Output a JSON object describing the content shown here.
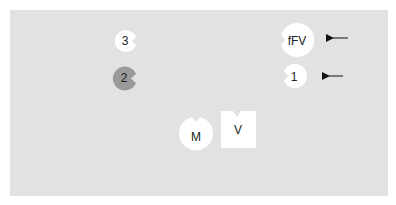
{
  "diagram": {
    "background_color": "#e2e2e2",
    "nodes": [
      {
        "id": "node-3",
        "label": "3",
        "shape": "notched-circle",
        "fill": "#ffffff"
      },
      {
        "id": "node-2",
        "label": "2",
        "shape": "notched-circle",
        "fill": "#9a9a9a"
      },
      {
        "id": "node-fFV",
        "label": "fFV",
        "shape": "notched-circle",
        "fill": "#ffffff"
      },
      {
        "id": "node-1",
        "label": "1",
        "shape": "notched-circle",
        "fill": "#ffffff"
      },
      {
        "id": "node-M",
        "label": "M",
        "shape": "notched-circle",
        "fill": "#ffffff"
      },
      {
        "id": "node-V",
        "label": "V",
        "shape": "notched-square",
        "fill": "#ffffff"
      }
    ],
    "arrows": [
      {
        "target": "fFV",
        "direction": "left"
      },
      {
        "target": "1",
        "direction": "left"
      }
    ]
  }
}
